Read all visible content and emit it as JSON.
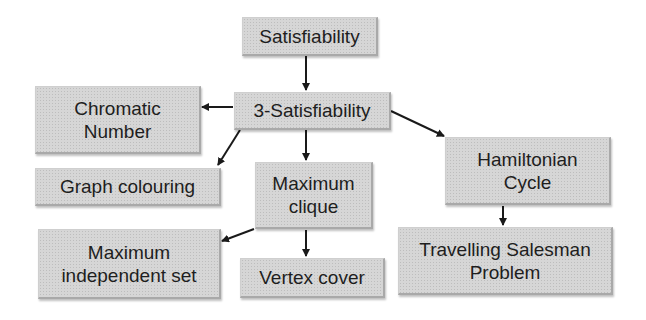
{
  "diagram": {
    "type": "reduction-tree",
    "nodes": [
      {
        "id": "sat",
        "label": "Satisfiability"
      },
      {
        "id": "sat3",
        "label": "3-Satisfiability"
      },
      {
        "id": "chromatic",
        "label": "Chromatic\nNumber"
      },
      {
        "id": "graph_colouring",
        "label": "Graph colouring"
      },
      {
        "id": "max_clique",
        "label": "Maximum\nclique"
      },
      {
        "id": "hamiltonian",
        "label": "Hamiltonian\nCycle"
      },
      {
        "id": "max_indep",
        "label": "Maximum\nindependent set"
      },
      {
        "id": "vertex_cover",
        "label": "Vertex cover"
      },
      {
        "id": "tsp",
        "label": "Travelling Salesman\nProblem"
      }
    ],
    "edges": [
      {
        "from": "sat",
        "to": "sat3"
      },
      {
        "from": "sat3",
        "to": "chromatic"
      },
      {
        "from": "sat3",
        "to": "graph_colouring"
      },
      {
        "from": "sat3",
        "to": "max_clique"
      },
      {
        "from": "sat3",
        "to": "hamiltonian"
      },
      {
        "from": "max_clique",
        "to": "max_indep"
      },
      {
        "from": "max_clique",
        "to": "vertex_cover"
      },
      {
        "from": "hamiltonian",
        "to": "tsp"
      }
    ],
    "colors": {
      "box_fill": "#d6d6d6",
      "arrow": "#1a1a1a",
      "text": "#1e1e1e"
    }
  }
}
